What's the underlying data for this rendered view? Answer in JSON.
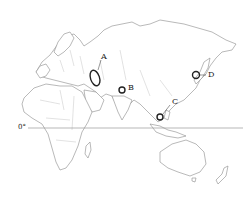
{
  "map": {
    "type": "outline map",
    "region": "Eastern Hemisphere (Europe, Africa, Asia, Oceania)",
    "equator_label": "0°",
    "markers": [
      {
        "id": "A",
        "label": "A",
        "shape": "ellipse",
        "location_hint": "Caspian Sea region"
      },
      {
        "id": "B",
        "label": "B",
        "shape": "circle",
        "location_hint": "northern South Asia"
      },
      {
        "id": "C",
        "label": "C",
        "shape": "circle",
        "location_hint": "Southeast Asia / South China Sea coast"
      },
      {
        "id": "D",
        "label": "D",
        "shape": "circle",
        "location_hint": "Japan / Korea region"
      }
    ],
    "colors": {
      "background": "#ffffff",
      "outline": "#8a8a8a",
      "marker": "#222222"
    }
  }
}
